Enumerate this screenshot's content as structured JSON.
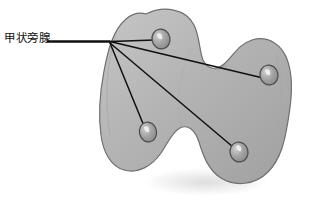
{
  "figure": {
    "background_color": "#ffffff",
    "labels": [
      {
        "id": "parathyroid",
        "text": "甲状旁腺",
        "x": 4,
        "y": 31,
        "color": "#111111"
      }
    ],
    "organ": {
      "name": "thyroid-gland",
      "fill_color": "#b4b4b4",
      "fill_color_light": "#c8c8c8",
      "fill_color_dark": "#9a9a9a",
      "outline_color": "#6f6f6f",
      "shadow_color": "#e2e2e2"
    },
    "markers": {
      "name": "parathyroid-gland-marker",
      "fill_color": "#9c9c9c",
      "outline_color": "#4a4a4a",
      "highlight_color": "#efefef",
      "count": 4,
      "positions": [
        {
          "id": "superior-left",
          "cx": 161,
          "cy": 39,
          "rx": 9,
          "ry": 10
        },
        {
          "id": "superior-right",
          "cx": 269,
          "cy": 75,
          "rx": 9,
          "ry": 10
        },
        {
          "id": "inferior-left",
          "cx": 148,
          "cy": 132,
          "rx": 8.5,
          "ry": 10
        },
        {
          "id": "inferior-right",
          "cx": 239,
          "cy": 152,
          "rx": 9,
          "ry": 10
        }
      ]
    },
    "leader_lines": {
      "name": "leader-line",
      "color": "#101010",
      "width": 1.6,
      "stem": {
        "x1": 47,
        "y1": 41.5,
        "x2": 110,
        "y2": 41.5,
        "width": 2.6
      },
      "hub": {
        "x": 110,
        "y": 41.5
      },
      "branches": [
        {
          "to": "superior-left",
          "x2": 155,
          "y2": 40
        },
        {
          "to": "superior-right",
          "x2": 263,
          "y2": 78
        },
        {
          "to": "inferior-left",
          "x2": 144,
          "y2": 126
        },
        {
          "to": "inferior-right",
          "x2": 233,
          "y2": 147
        }
      ]
    }
  }
}
